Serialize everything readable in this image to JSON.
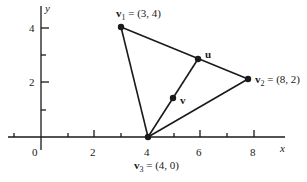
{
  "diagram": {
    "axes": {
      "x_label": "x",
      "y_label": "y",
      "x_ticks": [
        "0",
        "2",
        "4",
        "6",
        "8"
      ],
      "y_ticks": [
        "2",
        "4"
      ]
    },
    "points": {
      "v1": {
        "name": "v",
        "sub": "1",
        "coords": " = (3, 4)"
      },
      "v2": {
        "name": "v",
        "sub": "2",
        "coords": " = (8, 2)"
      },
      "v3": {
        "name": "v",
        "sub": "3",
        "coords": " = (4, 0)"
      },
      "u": {
        "name": "u"
      },
      "v": {
        "name": "v"
      }
    },
    "colors": {
      "ink": "#1a1a1a",
      "background": "#ffffff"
    }
  }
}
